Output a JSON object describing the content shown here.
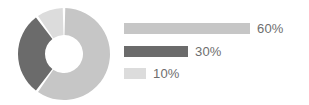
{
  "chart_data": {
    "type": "pie",
    "title": "",
    "subtitle": "",
    "xlabel": "",
    "ylabel": "",
    "variant": "donut",
    "grid": false,
    "legend_position": "right",
    "categories": [
      "60%",
      "30%",
      "10%"
    ],
    "values": [
      60,
      30,
      10
    ],
    "data_labels": [
      "60%",
      "30%",
      "10%"
    ],
    "colors": [
      "#c6c6c6",
      "#6b6b6b",
      "#dcdcdc"
    ],
    "series": [
      {
        "name": "share",
        "values": [
          60,
          30,
          10
        ]
      }
    ],
    "slices": [
      {
        "label": "60%",
        "value": 60,
        "color": "#c6c6c6",
        "start_angle_deg": 0,
        "end_angle_deg": 216
      },
      {
        "label": "30%",
        "value": 30,
        "color": "#6b6b6b",
        "start_angle_deg": 216,
        "end_angle_deg": 324
      },
      {
        "label": "10%",
        "value": 10,
        "color": "#dcdcdc",
        "start_angle_deg": 324,
        "end_angle_deg": 360
      }
    ],
    "legend": [
      {
        "label": "60%",
        "value": 60,
        "color": "#c6c6c6",
        "bar_width_px": 126
      },
      {
        "label": "30%",
        "value": 30,
        "color": "#6b6b6b",
        "bar_width_px": 64
      },
      {
        "label": "10%",
        "value": 10,
        "color": "#dcdcdc",
        "bar_width_px": 22
      }
    ],
    "donut": {
      "center_x": 47,
      "center_y": 47,
      "outer_radius": 46,
      "inner_radius": 19,
      "separator_color": "#ffffff"
    },
    "background_color": "#ffffff",
    "text_color": "#6e6e6e"
  }
}
